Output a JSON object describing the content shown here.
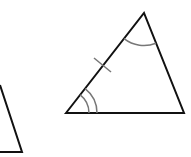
{
  "diagram": {
    "type": "geometry-triangles",
    "background": "#ffffff",
    "stroke_color": "#111111",
    "mark_color": "#777777",
    "partial_triangle": {
      "points": [
        [
          0,
          85
        ],
        [
          22,
          152
        ],
        [
          0,
          152
        ]
      ],
      "edges": [
        [
          [
            0,
            85
          ],
          [
            22,
            152
          ]
        ],
        [
          [
            22,
            152
          ],
          [
            0,
            152
          ]
        ]
      ]
    },
    "main_triangle": {
      "vertices": {
        "bottom_left": [
          66,
          113
        ],
        "apex": [
          144,
          13
        ],
        "bottom_right": [
          184,
          113
        ]
      },
      "marks": {
        "side_tick": {
          "on_side": "bottom_left-apex",
          "count": 1
        },
        "angle_bottom_left": {
          "arcs": 2
        },
        "angle_apex": {
          "arcs": 1
        }
      }
    }
  }
}
